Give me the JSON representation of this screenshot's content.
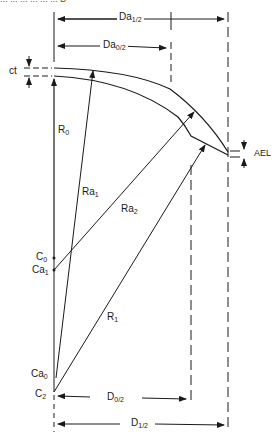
{
  "caption_fragment": "... ... ... ... ... ... B",
  "labels": {
    "Da1_2": {
      "base": "Da",
      "sub": "1/2"
    },
    "Da0_2": {
      "base": "Da",
      "sub": "0/2"
    },
    "ct": {
      "base": "ct",
      "sub": ""
    },
    "AEL": {
      "base": "AEL",
      "sub": ""
    },
    "R0": {
      "base": "R",
      "sub": "0"
    },
    "Ra1": {
      "base": "Ra",
      "sub": "1"
    },
    "Ra2": {
      "base": "Ra",
      "sub": "2"
    },
    "R1": {
      "base": "R",
      "sub": "1"
    },
    "C0": {
      "base": "C",
      "sub": "0"
    },
    "Ca1": {
      "base": "Ca",
      "sub": "1"
    },
    "Ca0": {
      "base": "Ca",
      "sub": "0"
    },
    "C2": {
      "base": "C",
      "sub": "2"
    },
    "D0_2": {
      "base": "D",
      "sub": "0/2"
    },
    "D1_2": {
      "base": "D",
      "sub": "1/2"
    }
  },
  "colors": {
    "line": "#1a1a1a",
    "background": "#ffffff"
  }
}
